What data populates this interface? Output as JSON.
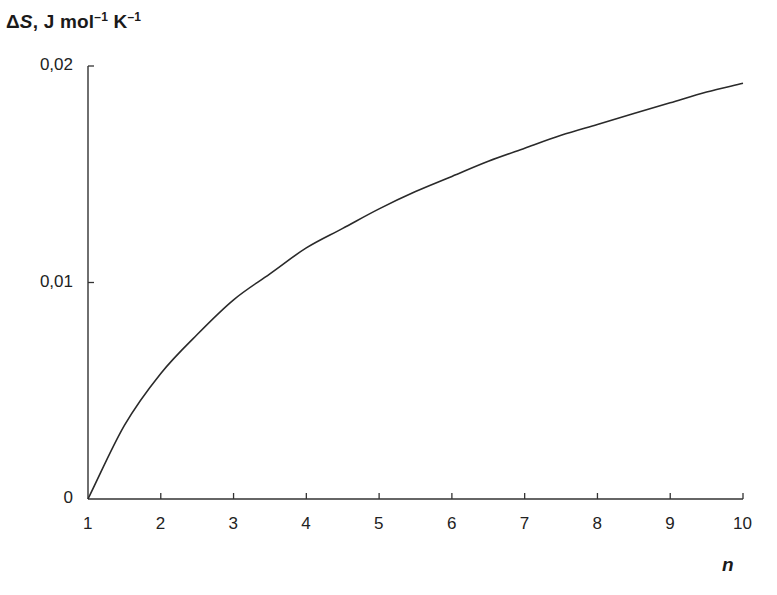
{
  "chart_data": {
    "type": "line",
    "title": "",
    "ylabel": "ΔS, J mol⁻¹ K⁻¹",
    "ylabel_parts": {
      "delta": "Δ",
      "symbol": "S",
      "rest": ", J mol",
      "exp1": "–1",
      "k": " K",
      "exp2": "–1"
    },
    "xlabel": "n",
    "xlim": [
      1,
      10
    ],
    "ylim": [
      0,
      0.02
    ],
    "x_ticks": [
      "1",
      "2",
      "3",
      "4",
      "5",
      "6",
      "7",
      "8",
      "9",
      "10"
    ],
    "y_ticks": [
      "0",
      "0,01",
      "0,02"
    ],
    "grid": false,
    "legend": null,
    "series": [
      {
        "name": "ΔS",
        "color": "#2a2a2a",
        "x": [
          1,
          1.5,
          2,
          2.5,
          3,
          3.5,
          4,
          4.5,
          5,
          5.5,
          6,
          6.5,
          7,
          7.5,
          8,
          8.5,
          9,
          9.5,
          10
        ],
        "values": [
          0,
          0.0034,
          0.0058,
          0.0076,
          0.0092,
          0.0104,
          0.0116,
          0.0125,
          0.0134,
          0.0142,
          0.0149,
          0.0156,
          0.0162,
          0.0168,
          0.0173,
          0.0178,
          0.0183,
          0.0188,
          0.0192
        ]
      }
    ]
  },
  "labels": {
    "y_delta": "Δ",
    "y_symbol": "S",
    "y_rest": ", J mol",
    "y_exp1": "–1",
    "y_k": " K",
    "y_exp2": "–1",
    "x_title": "n",
    "y_ticks": [
      "0",
      "0,01",
      "0,02"
    ],
    "x_ticks": [
      "1",
      "2",
      "3",
      "4",
      "5",
      "6",
      "7",
      "8",
      "9",
      "10"
    ]
  }
}
